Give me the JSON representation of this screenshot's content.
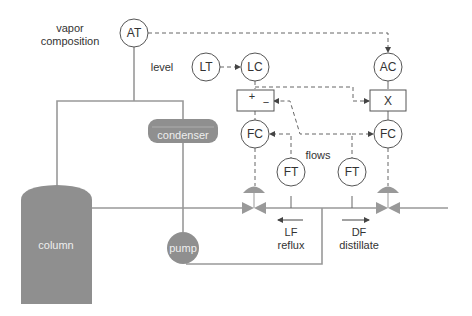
{
  "labels": {
    "vapor_line1": "vapor",
    "vapor_line2": "composition",
    "level": "level",
    "flows": "flows",
    "lf_line1": "LF",
    "lf_line2": "reflux",
    "df_line1": "DF",
    "df_line2": "distillate"
  },
  "equipment": {
    "column": "column",
    "condenser": "condenser",
    "pump": "pump"
  },
  "instruments": {
    "at": "AT",
    "lt": "LT",
    "lc": "LC",
    "ac": "AC",
    "fc_left": "FC",
    "fc_right": "FC",
    "ft_left": "FT",
    "ft_right": "FT"
  },
  "blocks": {
    "summer_plus": "+",
    "summer_minus": "−",
    "multiplier": "X"
  },
  "colors": {
    "equipment": "#8f8f8f",
    "pipe": "#999999",
    "signal": "#666666"
  }
}
